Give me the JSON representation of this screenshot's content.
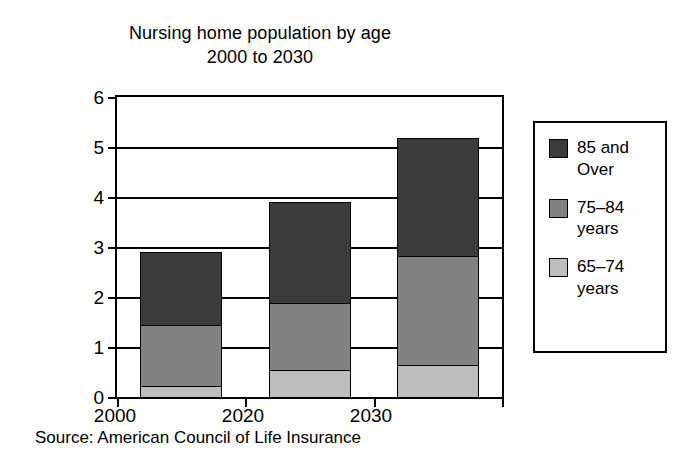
{
  "chart_data": {
    "type": "bar",
    "subtype": "stacked-bar-vertical",
    "title": "Nursing home population by age",
    "subtitle": "2000 to 2030",
    "xlabel": "",
    "ylabel": "Millions",
    "categories": [
      "2000",
      "2020",
      "2030"
    ],
    "ylim": [
      0,
      6
    ],
    "yticks": [
      0,
      1,
      2,
      3,
      4,
      5,
      6
    ],
    "ytick_labels": [
      "0",
      "1",
      "2",
      "3",
      "4",
      "5",
      "6"
    ],
    "grid": true,
    "grid_axis": "y",
    "legend_position": "right-outside",
    "stack_order_bottom_to_top": [
      "65-74 years",
      "75-84 years",
      "85 and Over"
    ],
    "series": [
      {
        "name": "65–74 years",
        "legend_label": "65–74\nyears",
        "color": "#bdbdbd",
        "values": [
          0.23,
          0.55,
          0.65
        ]
      },
      {
        "name": "75–84 years",
        "legend_label": "75–84\nyears",
        "color": "#828282",
        "values": [
          1.22,
          1.33,
          2.18
        ]
      },
      {
        "name": "85 and Over",
        "legend_label": "85 and\nOver",
        "color": "#3b3b3b",
        "values": [
          1.45,
          2.02,
          2.35
        ]
      }
    ],
    "cumulative_tops": {
      "2000": [
        0.23,
        1.45,
        2.9
      ],
      "2020": [
        0.55,
        1.88,
        3.9
      ],
      "2030": [
        0.65,
        2.83,
        5.18
      ]
    },
    "totals": [
      2.9,
      3.9,
      5.18
    ],
    "annotations": [
      "Source: American Council of Life Insurance"
    ]
  },
  "title": {
    "line1": "Nursing home population by age",
    "line2": "2000 to 2030"
  },
  "axes": {
    "y_title": "Millions",
    "y_ticks": [
      "6",
      "5",
      "4",
      "3",
      "2",
      "1",
      "0"
    ],
    "x_ticks": [
      "2000",
      "2020",
      "2030"
    ]
  },
  "legend": {
    "items": [
      {
        "label": "85 and\nOver",
        "color": "#3b3b3b"
      },
      {
        "label": "75–84\nyears",
        "color": "#828282"
      },
      {
        "label": "65–74\nyears",
        "color": "#bdbdbd"
      }
    ]
  },
  "source": "Source: American Council of Life Insurance",
  "colors": {
    "age_85_plus": "#3b3b3b",
    "age_75_84": "#828282",
    "age_65_74": "#bdbdbd",
    "axis": "#000000",
    "background": "#ffffff"
  }
}
